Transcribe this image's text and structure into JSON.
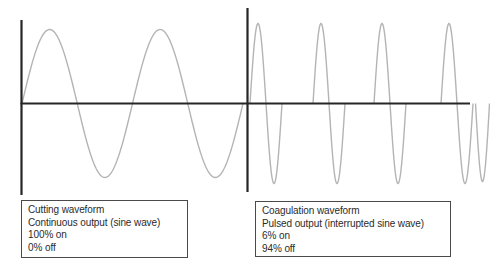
{
  "figure": {
    "background_color": "#ffffff",
    "wave_color": "#b4b4b4",
    "axis_color": "#262626",
    "box_border_color": "#4a4a4a",
    "text_color": "#2b2b2b"
  },
  "left_panel": {
    "label_box": {
      "lines": [
        "Cutting waveform",
        "Continuous output (sine wave)",
        "100% on",
        "0% off"
      ]
    }
  },
  "right_panel": {
    "label_box": {
      "lines": [
        "Coagulation waveform",
        "Pulsed output (interrupted sine wave)",
        "6% on",
        "94% off"
      ]
    }
  },
  "chart_data": [
    {
      "type": "line",
      "title": "Cutting waveform",
      "waveform": "continuous sine wave",
      "duty_on": "100%",
      "duty_off": "0%",
      "cycles_shown": 2,
      "geometry": {
        "x_start": 22,
        "x_end": 243,
        "period_px": 110.5,
        "amplitude_px": 74,
        "axis_y": 103.5,
        "axis_x_start": 20.5,
        "axis_x_end": 247,
        "yaxis_x": 21.5,
        "yaxis_top": 20,
        "yaxis_bottom": 195
      }
    },
    {
      "type": "line",
      "title": "Coagulation waveform",
      "waveform": "pulsed / interrupted sine wave bursts",
      "duty_on": "6%",
      "duty_off": "94%",
      "bursts_shown": 4,
      "geometry": {
        "burst_starts": [
          250,
          313,
          374,
          441
        ],
        "burst_period_px": 32,
        "amplitude_px": 80,
        "axis_y": 103.5,
        "axis_x_start": 247,
        "axis_x_end": 470,
        "yaxis_x": 247.5,
        "yaxis_top": 8,
        "yaxis_bottom": 192,
        "tail": {
          "x_start": 475.5,
          "width": 14,
          "amplitude_px": 78
        }
      }
    }
  ]
}
